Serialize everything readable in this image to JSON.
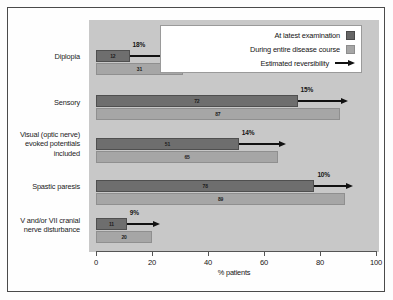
{
  "chart_data": {
    "type": "bar",
    "orientation": "horizontal",
    "title": "",
    "xlabel": "% patients",
    "ylabel": "",
    "xlim": [
      0,
      100
    ],
    "xticks": [
      0,
      20,
      40,
      60,
      80,
      100
    ],
    "grid": false,
    "legend_position": "top-right",
    "categories": [
      "Diplopia",
      "Sensory",
      "Visual (optic nerve)\nevoked potentials\nincluded",
      "Spastic paresis",
      "V and/or VII cranial\nnerve disturbance"
    ],
    "series": [
      {
        "name": "At latest examination",
        "color": "#6e6e6e",
        "values": [
          12,
          72,
          51,
          78,
          11
        ]
      },
      {
        "name": "During entire disease course",
        "color": "#a6a6a6",
        "values": [
          31,
          87,
          65,
          89,
          20
        ]
      }
    ],
    "annotations": {
      "name": "Estimated reversibility",
      "labels": [
        "18%",
        "15%",
        "14%",
        "10%",
        "9%"
      ],
      "values": [
        18,
        15,
        14,
        10,
        9
      ]
    }
  },
  "legend": {
    "items": [
      {
        "label": "At latest examination",
        "marker": "dark-swatch"
      },
      {
        "label": "During entire disease course",
        "marker": "light-swatch"
      },
      {
        "label": "Estimated reversibility",
        "marker": "arrow-icon"
      }
    ]
  },
  "axis": {
    "ticks": [
      "0",
      "20",
      "40",
      "60",
      "80",
      "100"
    ],
    "xlabel": "% patients"
  },
  "rows": [
    {
      "category": "Diplopia",
      "dark": 12,
      "light": 31,
      "dark_label": "12",
      "light_label": "31",
      "pct": "18%"
    },
    {
      "category": "Sensory",
      "dark": 72,
      "light": 87,
      "dark_label": "72",
      "light_label": "87",
      "pct": "15%"
    },
    {
      "category": "Visual (optic nerve)\nevoked potentials\nincluded",
      "dark": 51,
      "light": 65,
      "dark_label": "51",
      "light_label": "65",
      "pct": "14%"
    },
    {
      "category": "Spastic paresis",
      "dark": 78,
      "light": 89,
      "dark_label": "78",
      "light_label": "89",
      "pct": "10%"
    },
    {
      "category": "V and/or VII cranial\nnerve disturbance",
      "dark": 11,
      "light": 20,
      "dark_label": "11",
      "light_label": "20",
      "pct": "9%"
    }
  ]
}
